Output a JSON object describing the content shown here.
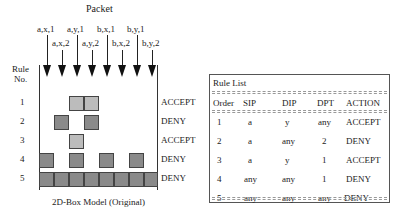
{
  "diagram": {
    "packet_label": "Packet",
    "packets_top": [
      "a,x,1",
      "a,y,1",
      "b,x,1",
      "b,y,1"
    ],
    "packets_bottom": [
      "a,x,2",
      "a,y,2",
      "b,x,2",
      "b,y,2"
    ],
    "rule_no_label_1": "Rule",
    "rule_no_label_2": "No.",
    "rows": [
      {
        "num": "1",
        "action": "ACCEPT",
        "type": "accept",
        "cols": [
          2,
          3
        ]
      },
      {
        "num": "2",
        "action": "DENY",
        "type": "deny",
        "cols": [
          1,
          3
        ]
      },
      {
        "num": "3",
        "action": "ACCEPT",
        "type": "accept",
        "cols": [
          2
        ]
      },
      {
        "num": "4",
        "action": "DENY",
        "type": "deny",
        "cols": [
          0,
          2,
          4,
          6
        ]
      },
      {
        "num": "5",
        "action": "DENY",
        "type": "deny",
        "cols": [
          0,
          1,
          2,
          3,
          4,
          5,
          6,
          7
        ]
      }
    ],
    "caption": "2D-Box Model (Original)"
  },
  "rule_list": {
    "title": "Rule List",
    "headers": [
      "Order",
      "SIP",
      "DIP",
      "DPT",
      "ACTION"
    ],
    "rows": [
      [
        "1",
        "a",
        "y",
        "any",
        "ACCEPT"
      ],
      [
        "2",
        "a",
        "any",
        "2",
        "DENY"
      ],
      [
        "3",
        "a",
        "y",
        "1",
        "ACCEPT"
      ],
      [
        "4",
        "any",
        "any",
        "1",
        "DENY"
      ],
      [
        "5",
        "any",
        "any",
        "any",
        "DENY"
      ]
    ]
  },
  "colors": {
    "deny_fill": "#8a8a8a",
    "accept_fill": "#e8e8e8",
    "line": "#222222"
  }
}
